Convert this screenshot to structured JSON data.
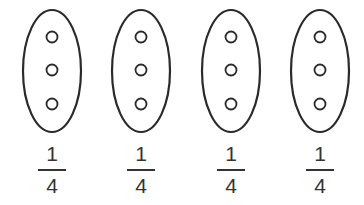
{
  "figure": {
    "stroke_color": "#2a2a2a",
    "text_color": "#333333",
    "groups": [
      {
        "dots": 3,
        "fraction": {
          "numerator": "1",
          "denominator": "4"
        },
        "cx": 52
      },
      {
        "dots": 3,
        "fraction": {
          "numerator": "1",
          "denominator": "4"
        },
        "cx": 141
      },
      {
        "dots": 3,
        "fraction": {
          "numerator": "1",
          "denominator": "4"
        },
        "cx": 231
      },
      {
        "dots": 3,
        "fraction": {
          "numerator": "1",
          "denominator": "4"
        },
        "cx": 320
      }
    ]
  }
}
